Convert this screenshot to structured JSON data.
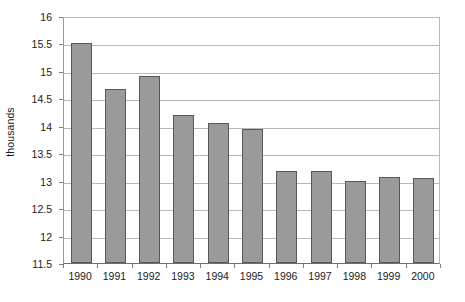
{
  "chart_data": {
    "type": "bar",
    "title": "",
    "subtitle": "",
    "xlabel": "",
    "ylabel": "thousands",
    "categories": [
      "1990",
      "1991",
      "1992",
      "1993",
      "1994",
      "1995",
      "1996",
      "1997",
      "1998",
      "1999",
      "2000"
    ],
    "values": [
      15.5,
      14.67,
      14.9,
      14.2,
      14.05,
      13.95,
      13.18,
      13.18,
      13.0,
      13.06,
      13.05
    ],
    "ylim": [
      11.5,
      16
    ],
    "ytick_labels": [
      "16",
      "15.5",
      "15",
      "14.5",
      "14",
      "13.5",
      "13",
      "12.5",
      "12",
      "11.5"
    ],
    "ytick_values": [
      16,
      15.5,
      15,
      14.5,
      14,
      13.5,
      13,
      12.5,
      12,
      11.5
    ],
    "grid": true,
    "grid_axis": "y",
    "legend": false,
    "legend_position": "none",
    "bar_fill_color": "#9a9a9a",
    "bar_border_color": "#585858",
    "gridline_color": "#b9b9b9",
    "axis_color": "#6f6f6f",
    "plot_background": "#ffffff"
  }
}
